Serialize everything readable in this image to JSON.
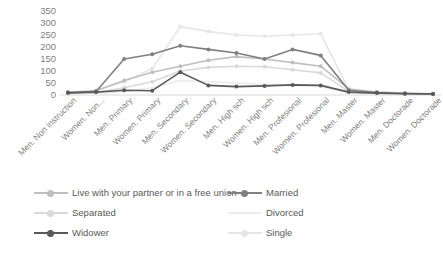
{
  "chart_data": {
    "type": "line",
    "title": "",
    "xlabel": "",
    "ylabel": "",
    "ylim": [
      0,
      350
    ],
    "ytick_step": 50,
    "yticks": [
      "350",
      "300",
      "250",
      "200",
      "150",
      "100",
      "50",
      "0"
    ],
    "grid": false,
    "legend_position": "bottom",
    "legend_columns": 2,
    "categories": [
      "Men. Non instruction",
      "Women. Non...",
      "Men. Primary",
      "Women. Primary",
      "Men. Secondary",
      "Women. Secondary",
      "Men. High sch",
      "Women. High sch",
      "Men. Profesional",
      "Women. Profesional",
      "Men. Master",
      "Women. Master",
      "Men. Doctorade",
      "Women. Doctorade"
    ],
    "series": [
      {
        "name": "Live with your partner or in a free union",
        "color": "#bfbfbf",
        "marker": "circle",
        "values": [
          10,
          18,
          60,
          95,
          120,
          145,
          160,
          150,
          135,
          120,
          25,
          12,
          8,
          5
        ]
      },
      {
        "name": "Married",
        "color": "#808080",
        "marker": "circle",
        "values": [
          8,
          15,
          150,
          170,
          205,
          190,
          175,
          150,
          190,
          165,
          20,
          10,
          6,
          4
        ]
      },
      {
        "name": "Separated",
        "color": "#d9d9d9",
        "marker": "circle",
        "values": [
          6,
          10,
          30,
          55,
          100,
          115,
          120,
          118,
          105,
          92,
          15,
          8,
          5,
          3
        ]
      },
      {
        "name": "Divorced",
        "color": "#ececec",
        "marker": "none",
        "values": [
          4,
          6,
          15,
          30,
          60,
          55,
          50,
          45,
          40,
          35,
          10,
          5,
          3,
          2
        ]
      },
      {
        "name": "Widower",
        "color": "#595959",
        "marker": "circle",
        "values": [
          10,
          12,
          20,
          18,
          95,
          40,
          35,
          38,
          42,
          40,
          12,
          8,
          5,
          4
        ]
      },
      {
        "name": "Single",
        "color": "#e6e6e6",
        "marker": "circle",
        "values": [
          12,
          20,
          55,
          110,
          285,
          265,
          250,
          245,
          250,
          255,
          22,
          12,
          7,
          5
        ]
      }
    ]
  }
}
